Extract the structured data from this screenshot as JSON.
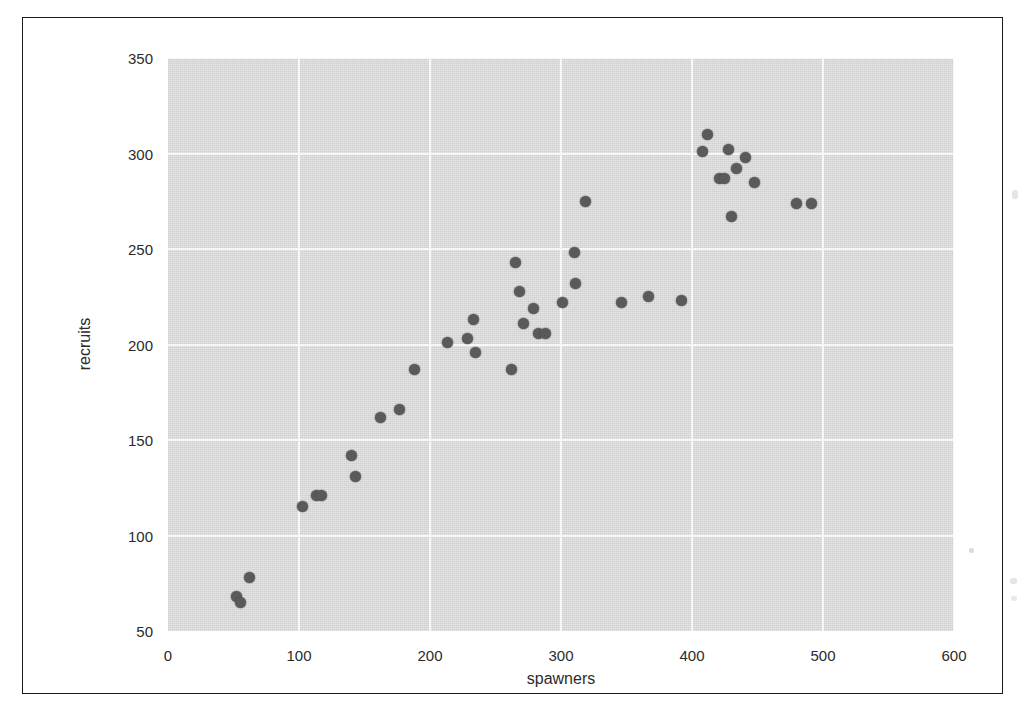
{
  "figure": {
    "background_color": "#ffffff",
    "panel_color": "#d9d9d9",
    "grid_color": "#f7f7f7",
    "point_color": "#5a5a5a",
    "frame_color": "#1a1a1a"
  },
  "chart_data": {
    "type": "scatter",
    "title": "",
    "xlabel": "spawners",
    "ylabel": "recruits",
    "xlim": [
      0,
      600
    ],
    "ylim": [
      50,
      350
    ],
    "xticks": [
      0,
      100,
      200,
      300,
      400,
      500,
      600
    ],
    "yticks": [
      50,
      100,
      150,
      200,
      250,
      300,
      350
    ],
    "grid": true,
    "legend": "none",
    "marker": "filled-circle",
    "n_points": 40,
    "points": [
      {
        "x": 52,
        "y": 68
      },
      {
        "x": 55,
        "y": 65
      },
      {
        "x": 62,
        "y": 78
      },
      {
        "x": 103,
        "y": 115
      },
      {
        "x": 113,
        "y": 121
      },
      {
        "x": 117,
        "y": 121
      },
      {
        "x": 140,
        "y": 142
      },
      {
        "x": 143,
        "y": 131
      },
      {
        "x": 162,
        "y": 162
      },
      {
        "x": 177,
        "y": 166
      },
      {
        "x": 188,
        "y": 187
      },
      {
        "x": 213,
        "y": 201
      },
      {
        "x": 229,
        "y": 203
      },
      {
        "x": 233,
        "y": 213
      },
      {
        "x": 235,
        "y": 196
      },
      {
        "x": 262,
        "y": 187
      },
      {
        "x": 265,
        "y": 243
      },
      {
        "x": 268,
        "y": 228
      },
      {
        "x": 271,
        "y": 211
      },
      {
        "x": 279,
        "y": 219
      },
      {
        "x": 283,
        "y": 206
      },
      {
        "x": 288,
        "y": 206
      },
      {
        "x": 301,
        "y": 222
      },
      {
        "x": 310,
        "y": 248
      },
      {
        "x": 311,
        "y": 232
      },
      {
        "x": 319,
        "y": 275
      },
      {
        "x": 346,
        "y": 222
      },
      {
        "x": 367,
        "y": 225
      },
      {
        "x": 392,
        "y": 223
      },
      {
        "x": 408,
        "y": 301
      },
      {
        "x": 412,
        "y": 310
      },
      {
        "x": 421,
        "y": 287
      },
      {
        "x": 425,
        "y": 287
      },
      {
        "x": 428,
        "y": 302
      },
      {
        "x": 430,
        "y": 267
      },
      {
        "x": 434,
        "y": 292
      },
      {
        "x": 441,
        "y": 298
      },
      {
        "x": 448,
        "y": 285
      },
      {
        "x": 480,
        "y": 274
      },
      {
        "x": 491,
        "y": 274
      }
    ]
  }
}
